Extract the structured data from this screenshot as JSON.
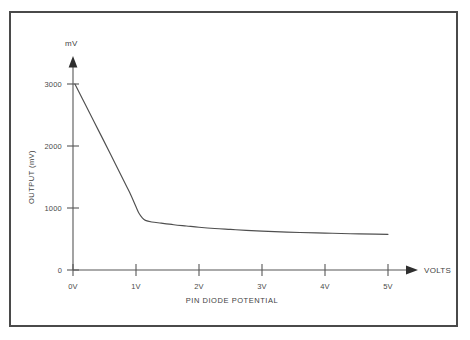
{
  "figure": {
    "frame_color": "#4a4a4a",
    "background": "#ffffff",
    "curve_color": "#4f4f4f",
    "axis_color": "#565656"
  },
  "axes": {
    "y_unit_label": "mV",
    "y_axis_title": "OUTPUT (mV)",
    "x_axis_title": "PIN DIODE POTENTIAL",
    "x_unit_label": "VOLTS",
    "y_ticks": [
      "0",
      "1000",
      "2000",
      "3000"
    ],
    "x_ticks": [
      "0V",
      "1V",
      "2V",
      "3V",
      "4V",
      "5V"
    ]
  },
  "chart_data": {
    "type": "line",
    "title": "",
    "subtitle": "",
    "xlabel": "PIN DIODE POTENTIAL",
    "ylabel": "OUTPUT (mV)",
    "x_unit": "VOLTS",
    "y_unit": "mV",
    "xlim": [
      0,
      5.5
    ],
    "ylim": [
      0,
      3300
    ],
    "xticks": [
      0,
      1,
      2,
      3,
      4,
      5
    ],
    "xticklabels": [
      "0V",
      "1V",
      "2V",
      "3V",
      "4V",
      "5V"
    ],
    "yticks": [
      0,
      1000,
      2000,
      3000
    ],
    "yticklabels": [
      "0",
      "1000",
      "2000",
      "3000"
    ],
    "grid": false,
    "legend": false,
    "legend_position": "none",
    "annotations": [],
    "series": [
      {
        "name": "PIN diode output",
        "x": [
          0.03,
          0.2,
          0.4,
          0.6,
          0.8,
          0.9,
          1.0,
          1.05,
          1.1,
          1.15,
          1.25,
          1.4,
          1.6,
          1.8,
          2.0,
          2.25,
          2.5,
          2.75,
          3.0,
          3.3,
          3.6,
          4.0,
          4.4,
          4.8,
          5.0
        ],
        "y": [
          3000,
          2660,
          2260,
          1860,
          1450,
          1250,
          1020,
          910,
          840,
          800,
          775,
          755,
          730,
          710,
          690,
          670,
          655,
          640,
          628,
          615,
          605,
          595,
          585,
          578,
          575
        ]
      }
    ]
  }
}
